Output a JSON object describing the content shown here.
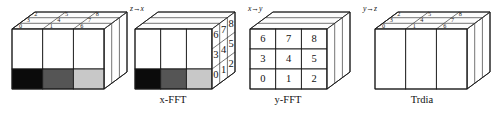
{
  "figure": {
    "title": "",
    "background_color": "#ffffff",
    "ink_color": "#111111",
    "stages": [
      {
        "id": "stage-1",
        "caption": "",
        "transition_label": "z→x",
        "shading": [
          "#0b0b0b",
          "#555555",
          "#c8c8c8"
        ],
        "top_face_numbers": [
          "0",
          "1",
          "6",
          "3",
          "4",
          "7",
          "2",
          "5",
          "8"
        ],
        "front_face_numbers": []
      },
      {
        "id": "stage-2",
        "caption": "x-FFT",
        "transition_label": "x→y",
        "shading": [
          "#0b0b0b",
          "#555555",
          "#c8c8c8"
        ],
        "top_face_numbers": [],
        "front_face_numbers": [
          "6",
          "7",
          "8",
          "3",
          "4",
          "5",
          "0",
          "1",
          "2"
        ]
      },
      {
        "id": "stage-3",
        "caption": "y-FFT",
        "transition_label": "y→z",
        "shading": [],
        "top_face_numbers": [],
        "front_face_numbers": [
          "6",
          "7",
          "8",
          "3",
          "4",
          "5",
          "0",
          "1",
          "2"
        ]
      },
      {
        "id": "stage-4",
        "caption": "Trdia",
        "transition_label": "",
        "shading": [],
        "top_face_numbers": [
          "0",
          "1",
          "6",
          "3",
          "4",
          "7",
          "2",
          "5",
          "8"
        ],
        "front_face_numbers": []
      }
    ],
    "labels": {
      "caption_1": "",
      "caption_2": "x-FFT",
      "caption_3": "y-FFT",
      "caption_4": "Trdia",
      "arrow_1": "z→x",
      "arrow_2": "x→y",
      "arrow_3": "y→z"
    },
    "grid_numbers": {
      "n0": "0",
      "n1": "1",
      "n2": "2",
      "n3": "3",
      "n4": "4",
      "n5": "5",
      "n6": "6",
      "n7": "7",
      "n8": "8"
    }
  }
}
